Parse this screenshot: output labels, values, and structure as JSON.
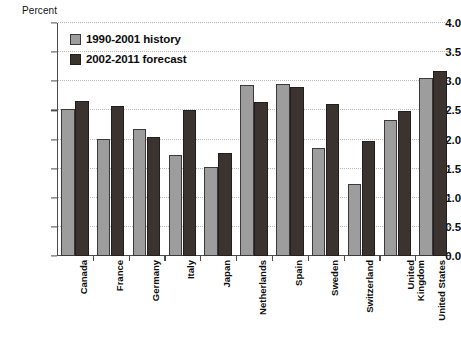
{
  "chart_data": {
    "type": "bar",
    "title": "",
    "xlabel": "",
    "ylabel": "Percent",
    "ylim": [
      0.0,
      4.0
    ],
    "ytick_step": 0.5,
    "ytick_labels": [
      "0.0",
      "0.5",
      "1.0",
      "1.5",
      "2.0",
      "2.5",
      "3.0",
      "3.5",
      "4.0"
    ],
    "grid": true,
    "legend_position": "top-left",
    "categories": [
      "Canada",
      "France",
      "Germany",
      "Italy",
      "Japan",
      "Netherlands",
      "Spain",
      "Sweden",
      "Switzerland",
      "United\nKingdom",
      "United States"
    ],
    "series": [
      {
        "name": "1990-2001 history",
        "color": "#9d9d9d",
        "values": [
          2.53,
          2.01,
          2.18,
          1.74,
          1.52,
          2.93,
          2.95,
          1.85,
          1.24,
          2.33,
          3.05
        ]
      },
      {
        "name": "2002-2011 forecast",
        "color": "#3b3330",
        "values": [
          2.66,
          2.57,
          2.04,
          2.51,
          1.76,
          2.65,
          2.9,
          2.61,
          1.98,
          2.49,
          3.17
        ]
      }
    ]
  }
}
